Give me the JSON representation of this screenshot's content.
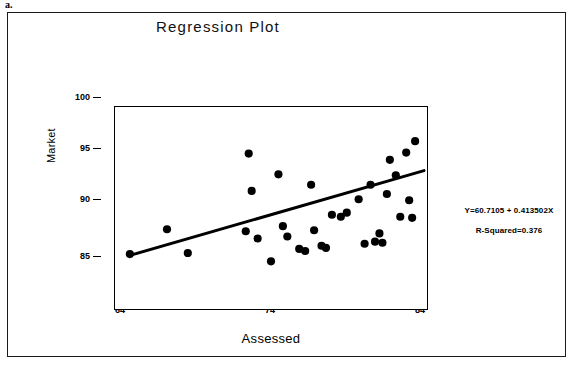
{
  "page_label": "a.",
  "figure": {
    "title": "Regression Plot",
    "annotation": {
      "equation": "Y=60.7105 + 0.413502X",
      "r_squared": "R-Squared=0.376"
    }
  },
  "axes": {
    "y_title": "Market",
    "x_title": "Assessed",
    "y_ticks": [
      "100",
      "95",
      "90",
      "85"
    ],
    "x_ticks": [
      "64",
      "74",
      "84"
    ]
  },
  "chart_data": {
    "type": "scatter",
    "title": "Regression Plot",
    "xlabel": "Assessed",
    "ylabel": "Market",
    "xlim": [
      63.0,
      84.0
    ],
    "ylim": [
      82.0,
      101.5
    ],
    "xticks": [
      64,
      74,
      84
    ],
    "yticks": [
      85,
      90,
      95,
      100
    ],
    "grid": false,
    "legend": false,
    "points": [
      {
        "x": 64.0,
        "y": 87.3
      },
      {
        "x": 66.5,
        "y": 89.7
      },
      {
        "x": 67.9,
        "y": 87.4
      },
      {
        "x": 71.8,
        "y": 89.5
      },
      {
        "x": 72.0,
        "y": 97.0
      },
      {
        "x": 72.2,
        "y": 93.4
      },
      {
        "x": 72.6,
        "y": 88.8
      },
      {
        "x": 73.5,
        "y": 86.6
      },
      {
        "x": 74.0,
        "y": 95.0
      },
      {
        "x": 74.3,
        "y": 90.0
      },
      {
        "x": 74.6,
        "y": 89.0
      },
      {
        "x": 75.4,
        "y": 87.8
      },
      {
        "x": 75.8,
        "y": 87.6
      },
      {
        "x": 76.2,
        "y": 94.0
      },
      {
        "x": 76.4,
        "y": 89.6
      },
      {
        "x": 76.9,
        "y": 88.1
      },
      {
        "x": 77.2,
        "y": 87.9
      },
      {
        "x": 77.6,
        "y": 91.1
      },
      {
        "x": 78.2,
        "y": 90.9
      },
      {
        "x": 78.6,
        "y": 91.3
      },
      {
        "x": 79.4,
        "y": 92.6
      },
      {
        "x": 79.8,
        "y": 88.3
      },
      {
        "x": 80.2,
        "y": 94.0
      },
      {
        "x": 80.5,
        "y": 88.5
      },
      {
        "x": 80.8,
        "y": 89.3
      },
      {
        "x": 81.0,
        "y": 88.4
      },
      {
        "x": 81.3,
        "y": 93.1
      },
      {
        "x": 81.5,
        "y": 96.4
      },
      {
        "x": 81.9,
        "y": 94.9
      },
      {
        "x": 82.2,
        "y": 90.9
      },
      {
        "x": 82.6,
        "y": 97.1
      },
      {
        "x": 82.8,
        "y": 92.5
      },
      {
        "x": 83.0,
        "y": 90.8
      },
      {
        "x": 83.2,
        "y": 98.2
      }
    ],
    "fit_line": {
      "label": "Y=60.7105 + 0.413502X",
      "intercept": 60.7105,
      "slope": 0.413502,
      "r_squared": 0.376,
      "x_start": 64.0,
      "x_end": 83.8
    }
  }
}
